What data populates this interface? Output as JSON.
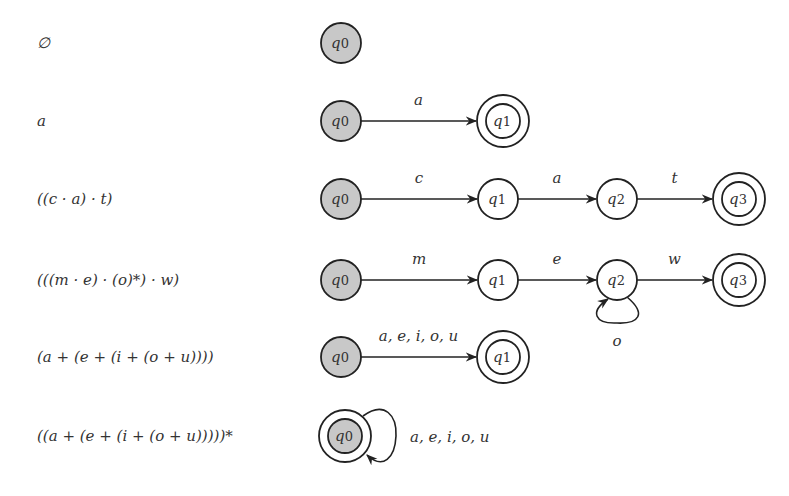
{
  "colors": {
    "stroke": "#222222",
    "initial_fill": "#c8c8c8",
    "fill": "#ffffff",
    "text": "#333333"
  },
  "rows": [
    {
      "expression": "∅",
      "y": 43,
      "states": [
        {
          "id": "q0",
          "label_base": "q",
          "label_sub": "0",
          "x": 341,
          "initial": true,
          "accepting": false
        }
      ],
      "transitions": []
    },
    {
      "expression": "a",
      "y": 121,
      "states": [
        {
          "id": "q0",
          "label_base": "q",
          "label_sub": "0",
          "x": 341,
          "initial": true,
          "accepting": false
        },
        {
          "id": "q1",
          "label_base": "q",
          "label_sub": "1",
          "x": 503,
          "initial": false,
          "accepting": true
        }
      ],
      "transitions": [
        {
          "from": "q0",
          "to": "q1",
          "label": "a"
        }
      ]
    },
    {
      "expression": "((c · a) · t)",
      "y": 199,
      "states": [
        {
          "id": "q0",
          "label_base": "q",
          "label_sub": "0",
          "x": 341,
          "initial": true,
          "accepting": false
        },
        {
          "id": "q1",
          "label_base": "q",
          "label_sub": "1",
          "x": 498,
          "initial": false,
          "accepting": false
        },
        {
          "id": "q2",
          "label_base": "q",
          "label_sub": "2",
          "x": 617,
          "initial": false,
          "accepting": false
        },
        {
          "id": "q3",
          "label_base": "q",
          "label_sub": "3",
          "x": 739,
          "initial": false,
          "accepting": true
        }
      ],
      "transitions": [
        {
          "from": "q0",
          "to": "q1",
          "label": "c"
        },
        {
          "from": "q1",
          "to": "q2",
          "label": "a"
        },
        {
          "from": "q2",
          "to": "q3",
          "label": "t"
        }
      ]
    },
    {
      "expression": "(((m · e) · (o)*) · w)",
      "y": 280,
      "states": [
        {
          "id": "q0",
          "label_base": "q",
          "label_sub": "0",
          "x": 341,
          "initial": true,
          "accepting": false
        },
        {
          "id": "q1",
          "label_base": "q",
          "label_sub": "1",
          "x": 498,
          "initial": false,
          "accepting": false
        },
        {
          "id": "q2",
          "label_base": "q",
          "label_sub": "2",
          "x": 617,
          "initial": false,
          "accepting": false
        },
        {
          "id": "q3",
          "label_base": "q",
          "label_sub": "3",
          "x": 739,
          "initial": false,
          "accepting": true
        }
      ],
      "transitions": [
        {
          "from": "q0",
          "to": "q1",
          "label": "m"
        },
        {
          "from": "q1",
          "to": "q2",
          "label": "e"
        },
        {
          "from": "q2",
          "to": "q2",
          "label": "o",
          "loop": "below"
        },
        {
          "from": "q2",
          "to": "q3",
          "label": "w"
        }
      ]
    },
    {
      "expression": "(a + (e + (i + (o + u))))",
      "y": 357,
      "states": [
        {
          "id": "q0",
          "label_base": "q",
          "label_sub": "0",
          "x": 341,
          "initial": true,
          "accepting": false
        },
        {
          "id": "q1",
          "label_base": "q",
          "label_sub": "1",
          "x": 503,
          "initial": false,
          "accepting": true
        }
      ],
      "transitions": [
        {
          "from": "q0",
          "to": "q1",
          "label": "a, e, i, o, u"
        }
      ]
    },
    {
      "expression": "((a + (e + (i + (o + u)))))*",
      "y": 436,
      "states": [
        {
          "id": "q0",
          "label_base": "q",
          "label_sub": "0",
          "x": 345,
          "initial": true,
          "accepting": true
        }
      ],
      "transitions": [
        {
          "from": "q0",
          "to": "q0",
          "label": "a, e, i, o, u",
          "loop": "right"
        }
      ]
    }
  ]
}
